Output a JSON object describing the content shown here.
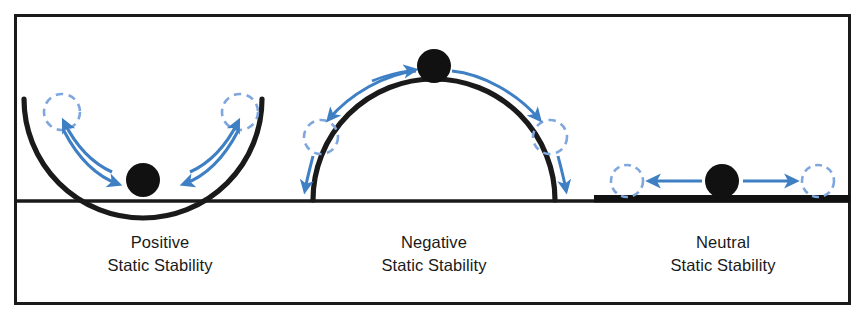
{
  "figure": {
    "background_color": "#ffffff",
    "frame": {
      "name": "outer-border",
      "color": "#1a1a1a",
      "x": 14,
      "y": 14,
      "width": 836,
      "height": 290,
      "stroke_width": 3
    },
    "ground_line": {
      "name": "ground-line",
      "color": "#1a1a1a",
      "y": 201,
      "x1": 15,
      "x2": 849,
      "stroke_width": 3.5
    },
    "colors": {
      "ink": "#1a1a1a",
      "arrow_blue": "#3f7fc4",
      "dashed_blue": "#7fa7de",
      "ball_fill": "#111111"
    }
  },
  "panels": [
    {
      "id": "positive",
      "name": "panel-positive-static-stability",
      "label_line1": "Positive",
      "label_line2": "Static Stability",
      "label_x": 160,
      "label_line1_y": 242,
      "label_line2_y": 264,
      "surface": "concave-bowl",
      "surface_description": "Upward-opening circular arc (bowl). Ball rests at the lowest point and returns to it after displacement.",
      "ball": {
        "cx": 143,
        "cy": 180,
        "r": 16
      },
      "ghost_balls": [
        {
          "cx": 62,
          "cy": 112,
          "r": 18
        },
        {
          "cx": 240,
          "cy": 112,
          "r": 18
        }
      ],
      "arrow_count": 4,
      "arrow_description": "Two curved arrows from each displaced (dashed) position back down toward the resting ball, and two returning outward."
    },
    {
      "id": "negative",
      "name": "panel-negative-static-stability",
      "label_line1": "Negative",
      "label_line2": "Static Stability",
      "label_x": 434,
      "label_line1_y": 242,
      "label_line2_y": 264,
      "surface": "convex-dome",
      "surface_description": "Semicircular dome. Ball balanced on the apex rolls away after displacement.",
      "ball": {
        "cx": 434,
        "cy": 67,
        "r": 16
      },
      "ghost_balls": [
        {
          "cx": 321,
          "cy": 137,
          "r": 17
        },
        {
          "cx": 550,
          "cy": 137,
          "r": 17
        }
      ],
      "arrow_count": 4,
      "arrow_description": "Curved arrows from the apex ball outward and downward on both sides, plus short arrows continuing down past the dashed circles."
    },
    {
      "id": "neutral",
      "name": "panel-neutral-static-stability",
      "label_line1": "Neutral",
      "label_line2": "Static Stability",
      "label_x": 723,
      "label_line1_y": 242,
      "label_line2_y": 264,
      "surface": "flat-platform",
      "surface_description": "Flat thick horizontal bar. Ball stays wherever it is displaced to.",
      "ball": {
        "cx": 722,
        "cy": 182,
        "r": 16
      },
      "ghost_balls": [
        {
          "cx": 627,
          "cy": 182,
          "r": 16
        },
        {
          "cx": 818,
          "cy": 182,
          "r": 16
        }
      ],
      "platform": {
        "x": 594,
        "y": 197,
        "width": 256,
        "height": 8
      },
      "arrow_count": 2,
      "arrow_description": "Two straight horizontal arrows pointing left and right away from the ball."
    }
  ]
}
